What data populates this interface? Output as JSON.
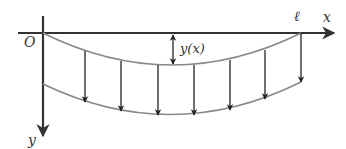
{
  "diagram": {
    "labels": {
      "origin": "O",
      "length": "ℓ",
      "x_axis": "x",
      "y_axis": "y",
      "deflection": "y(x)"
    },
    "colors": {
      "axis": "#333333",
      "curve": "#888888",
      "arrow": "#222222",
      "background": "#ffffff"
    },
    "load_arrow_count": 7
  }
}
